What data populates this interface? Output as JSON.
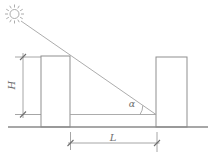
{
  "diagram": {
    "labels": {
      "height": "H",
      "spacing": "L",
      "sun_angle": "α"
    },
    "colors": {
      "line": "#a3a3a3",
      "structure_line": "#8f8f8f",
      "dimension_tick": "#6e6e6e",
      "text": "#6f6f6f",
      "background": "#ffffff"
    }
  }
}
